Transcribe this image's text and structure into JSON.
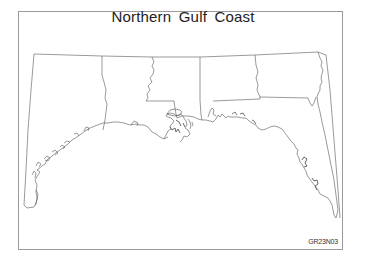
{
  "map": {
    "title": "Northern Gulf Coast",
    "figure_code": "GR23N03",
    "regions": [
      {
        "name": "Texas",
        "type": "state"
      },
      {
        "name": "Louisiana",
        "type": "state"
      },
      {
        "name": "Mississippi",
        "type": "state"
      },
      {
        "name": "Alabama",
        "type": "state"
      },
      {
        "name": "Georgia",
        "type": "state"
      },
      {
        "name": "Florida",
        "type": "state"
      }
    ],
    "colors": {
      "outline": "#555555",
      "frame": "#9a9a9a",
      "background": "#ffffff",
      "text": "#222222"
    }
  }
}
